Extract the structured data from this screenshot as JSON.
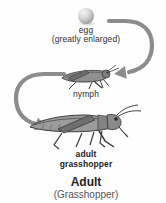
{
  "diagram": {
    "egg": {
      "label": "egg",
      "note": "(greatly enlarged)"
    },
    "nymph": {
      "label": "nymph"
    },
    "adult": {
      "label_line1": "adult",
      "label_line2": "grasshopper"
    },
    "caption": {
      "title": "Adult",
      "subtitle": "(Grasshopper)"
    },
    "icons": {
      "egg": "egg-icon",
      "egg_to_nymph": "curved-arrow-right-icon",
      "nymph": "nymph-grasshopper-icon",
      "nymph_to_adult": "curved-arrow-left-icon",
      "adult": "adult-grasshopper-icon"
    },
    "colors": {
      "background": "#fefefe",
      "arrow": "#8c8c8c",
      "label_text": "#303030",
      "caption_title": "#1f1f1f",
      "caption_subtitle": "#555555",
      "insect_body": "#9b9b9b",
      "insect_outline": "#3e3e3e"
    }
  }
}
